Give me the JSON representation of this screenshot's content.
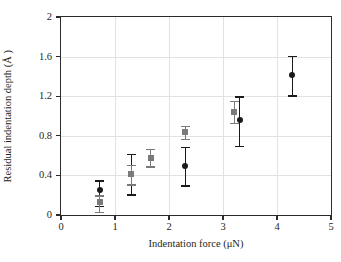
{
  "chart_data": {
    "type": "scatter",
    "title": "",
    "xlabel": "Indentation force (μN)",
    "ylabel": "Residual indentation depth (Å )",
    "xlim": [
      0,
      5
    ],
    "ylim": [
      0,
      2
    ],
    "xticks": [
      "0",
      "1",
      "2",
      "3",
      "4",
      "5"
    ],
    "xtick_values": [
      0,
      1,
      2,
      3,
      4,
      5
    ],
    "yticks": [
      "0",
      "0.4",
      "0.8",
      "1.2",
      "1.6",
      "2"
    ],
    "ytick_values": [
      0,
      0.4,
      0.8,
      1.2,
      1.6,
      2
    ],
    "grid": true,
    "legend": "none",
    "error_bars": "vertical",
    "series": [
      {
        "name": "black-circles",
        "marker": "circle",
        "color": "#1a1a1a",
        "points": [
          {
            "x": 0.72,
            "y": 0.25,
            "yerr_low": 0.16,
            "yerr_high": 0.1
          },
          {
            "x": 1.3,
            "y": 0.41,
            "yerr_low": 0.2,
            "yerr_high": 0.21
          },
          {
            "x": 2.3,
            "y": 0.5,
            "yerr_low": 0.2,
            "yerr_high": 0.19
          },
          {
            "x": 3.31,
            "y": 0.96,
            "yerr_low": 0.26,
            "yerr_high": 0.24
          },
          {
            "x": 4.28,
            "y": 1.41,
            "yerr_low": 0.2,
            "yerr_high": 0.2
          }
        ]
      },
      {
        "name": "gray-squares",
        "marker": "square",
        "color": "#7a7a7a",
        "points": [
          {
            "x": 0.72,
            "y": 0.13,
            "yerr_low": 0.1,
            "yerr_high": 0.07
          },
          {
            "x": 1.3,
            "y": 0.41,
            "yerr_low": 0.1,
            "yerr_high": 0.1
          },
          {
            "x": 1.66,
            "y": 0.58,
            "yerr_low": 0.09,
            "yerr_high": 0.09
          },
          {
            "x": 2.3,
            "y": 0.84,
            "yerr_low": 0.07,
            "yerr_high": 0.06
          },
          {
            "x": 3.21,
            "y": 1.04,
            "yerr_low": 0.11,
            "yerr_high": 0.11
          }
        ]
      }
    ]
  }
}
